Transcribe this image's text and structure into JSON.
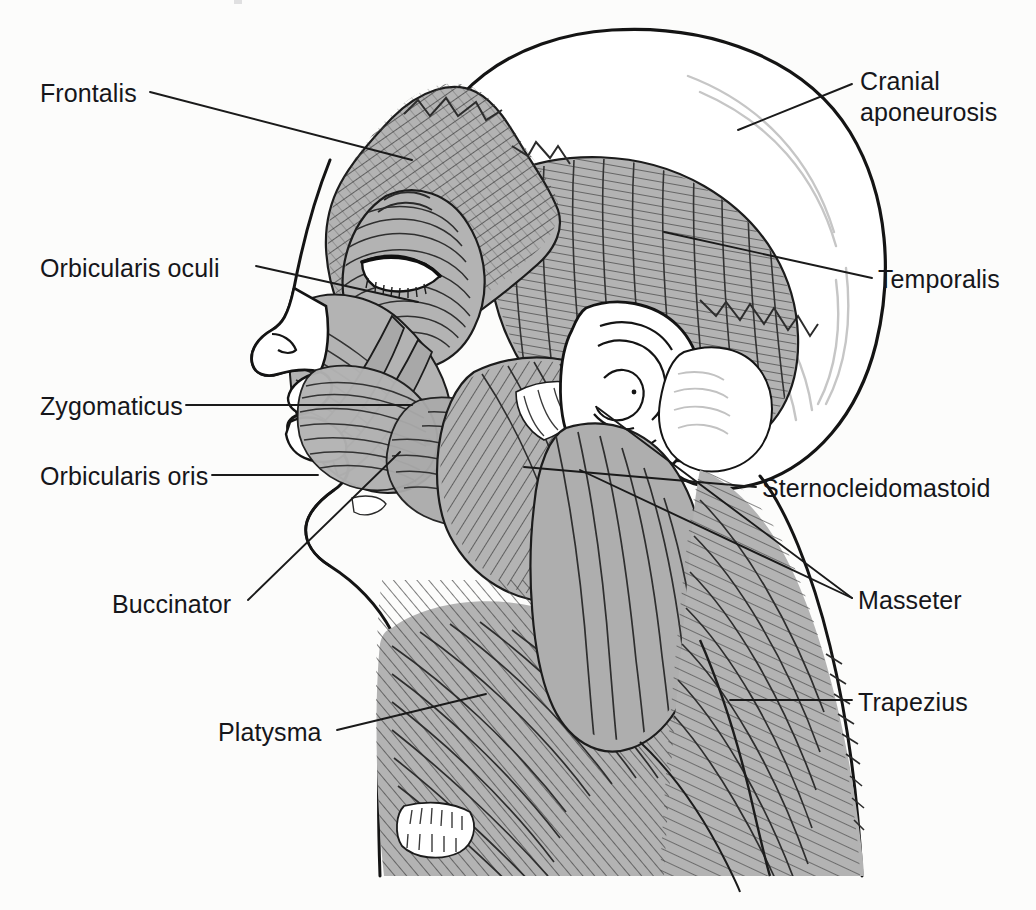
{
  "figure": {
    "kind": "anatomical-illustration",
    "view": "lateral (left side of head and neck)",
    "background_color": "#fcfcfb",
    "muscle_fill_color": "#b3b3b3",
    "muscle_fill_dark": "#9a9a9a",
    "outline_color": "#1a1a1a",
    "hatch_color": "#3a3a3a",
    "bone_fill_color": "#ffffff",
    "leader_line_color": "#1a1a1a",
    "label_text_color": "#16161a"
  },
  "labels": [
    {
      "id": "frontalis",
      "text": "Frontalis",
      "side": "left",
      "x": 40,
      "y": 78,
      "leader": [
        [
          150,
          92
        ],
        [
          412,
          160
        ]
      ]
    },
    {
      "id": "orbicularis-oculi",
      "text": "Orbicularis oculi",
      "side": "left",
      "x": 40,
      "y": 253,
      "leader": [
        [
          256,
          266
        ],
        [
          418,
          302
        ]
      ]
    },
    {
      "id": "zygomaticus",
      "text": "Zygomaticus",
      "side": "left",
      "x": 40,
      "y": 391,
      "leader": [
        [
          186,
          405
        ],
        [
          412,
          405
        ]
      ]
    },
    {
      "id": "orbicularis-oris",
      "text": "Orbicularis oris",
      "side": "left",
      "x": 40,
      "y": 461,
      "leader": [
        [
          212,
          475
        ],
        [
          318,
          475
        ]
      ]
    },
    {
      "id": "buccinator",
      "text": "Buccinator",
      "side": "left",
      "x": 112,
      "y": 589,
      "leader": [
        [
          248,
          600
        ],
        [
          400,
          452
        ]
      ]
    },
    {
      "id": "platysma",
      "text": "Platysma",
      "side": "left",
      "x": 218,
      "y": 717,
      "leader": [
        [
          337,
          730
        ],
        [
          486,
          694
        ]
      ]
    },
    {
      "id": "cranial-aponeurosis",
      "text": "Cranial\naponeurosis",
      "side": "right",
      "x": 860,
      "y": 66,
      "leader": [
        [
          852,
          84
        ],
        [
          738,
          130
        ]
      ]
    },
    {
      "id": "temporalis",
      "text": "Temporalis",
      "side": "right",
      "x": 878,
      "y": 264,
      "leader": [
        [
          872,
          278
        ],
        [
          664,
          232
        ]
      ]
    },
    {
      "id": "sternocleidomastoid",
      "text": "Sternocleidomastoid",
      "side": "right",
      "x": 762,
      "y": 473,
      "leader": [
        [
          756,
          487
        ],
        [
          524,
          467
        ]
      ]
    },
    {
      "id": "masseter",
      "text": "Masseter",
      "side": "right",
      "x": 858,
      "y": 585,
      "leader_group": [
        [
          [
            852,
            598
          ],
          [
            580,
            470
          ]
        ],
        [
          [
            852,
            598
          ],
          [
            598,
            408
          ]
        ]
      ]
    },
    {
      "id": "trapezius",
      "text": "Trapezius",
      "side": "right",
      "x": 858,
      "y": 687,
      "leader": [
        [
          852,
          700
        ],
        [
          730,
          700
        ]
      ]
    }
  ],
  "structures": [
    {
      "id": "cranium",
      "name": "cranial vault / skull",
      "fill": "#ffffff"
    },
    {
      "id": "frontalis-muscle",
      "name": "frontalis",
      "fill": "#b3b3b3"
    },
    {
      "id": "temporalis-muscle",
      "name": "temporalis",
      "fill": "#b3b3b3"
    },
    {
      "id": "orbicularis-oculi-muscle",
      "name": "orbicularis oculi",
      "fill": "#b3b3b3"
    },
    {
      "id": "zygomaticus-muscle",
      "name": "zygomaticus",
      "fill": "#b3b3b3"
    },
    {
      "id": "orbicularis-oris-muscle",
      "name": "orbicularis oris",
      "fill": "#b3b3b3"
    },
    {
      "id": "buccinator-muscle",
      "name": "buccinator",
      "fill": "#b3b3b3"
    },
    {
      "id": "masseter-muscle",
      "name": "masseter",
      "fill": "#b3b3b3"
    },
    {
      "id": "sternocleidomastoid-muscle",
      "name": "sternocleidomastoid",
      "fill": "#b3b3b3"
    },
    {
      "id": "platysma-muscle",
      "name": "platysma",
      "fill": "#b3b3b3"
    },
    {
      "id": "trapezius-muscle",
      "name": "trapezius",
      "fill": "#b3b3b3"
    },
    {
      "id": "ear",
      "name": "auricle (external ear)",
      "fill": "#ffffff"
    },
    {
      "id": "nose",
      "name": "nose",
      "fill": "#ffffff"
    },
    {
      "id": "lips",
      "name": "lips",
      "fill": "#ffffff"
    },
    {
      "id": "clavicle",
      "name": "clavicle",
      "fill": "#ffffff"
    }
  ]
}
